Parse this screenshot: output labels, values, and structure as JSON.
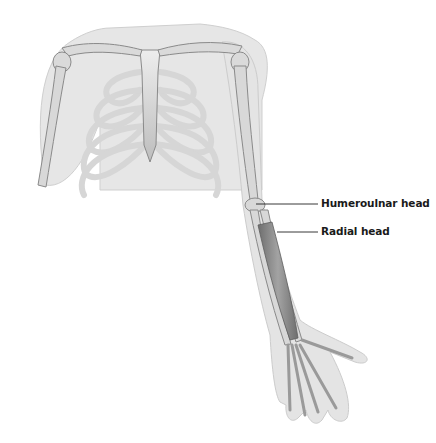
{
  "figure": {
    "colors": {
      "background": "#ffffff",
      "skin": "#e4e4e4",
      "skin_edge": "#c8c8c8",
      "bone": "#d9d9d9",
      "bone_edge": "#8a8a8a",
      "muscle": "#8c8c8c",
      "leader_line": "#222222",
      "label_text": "#1a1a1a"
    },
    "labels": [
      {
        "id": "humeroulnar",
        "text": "Humeroulnar head",
        "x": 321,
        "y": 197,
        "line": {
          "x1": 256,
          "y1": 204,
          "x2": 318,
          "y2": 204
        }
      },
      {
        "id": "radial",
        "text": "Radial head",
        "x": 321,
        "y": 225,
        "line": {
          "x1": 277,
          "y1": 232,
          "x2": 318,
          "y2": 232
        }
      }
    ]
  }
}
